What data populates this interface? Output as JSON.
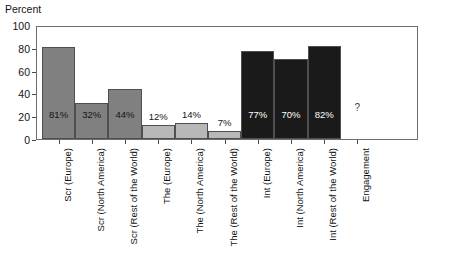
{
  "chart_data": {
    "type": "bar",
    "title": "",
    "ylabel": "Percent",
    "xlabel": "",
    "ylim": [
      0,
      100
    ],
    "yticks": [
      0,
      20,
      40,
      60,
      80,
      100
    ],
    "grid": false,
    "legend": "none",
    "categories": [
      "Scr (Europe)",
      "Scr (North America)",
      "Scr (Rest of the World)",
      "The (Europe)",
      "The (North America)",
      "The (Rest of the World)",
      "Int (Europe)",
      "Int (North America)",
      "Int (Rest of the World)",
      "Engagement"
    ],
    "values": [
      81,
      32,
      44,
      12,
      14,
      7,
      77,
      70,
      82,
      null
    ],
    "value_labels": [
      "81%",
      "32%",
      "44%",
      "12%",
      "14%",
      "7%",
      "77%",
      "70%",
      "82%",
      "?"
    ],
    "groups": [
      "Scr",
      "Scr",
      "Scr",
      "The",
      "The",
      "The",
      "Int",
      "Int",
      "Int",
      "Engagement"
    ],
    "group_colors": {
      "Scr": "#808080",
      "The": "#b8b8b8",
      "Int": "#1a1a1a",
      "Engagement": "#ffffff"
    },
    "label_colors": {
      "Scr": "#141414",
      "The": "#141414",
      "Int": "#ffffff",
      "Engagement": "#3c3c3c"
    },
    "label_placement": [
      "inside",
      "inside",
      "inside",
      "above",
      "above",
      "above",
      "inside",
      "inside",
      "inside",
      "none"
    ],
    "bar_edge_color": "#4f4f4f",
    "frame_color": "#6d6d6d"
  },
  "axis": {
    "y_title": "Percent",
    "y_tick_labels": [
      "100",
      "80",
      "60",
      "40",
      "20",
      "0"
    ]
  }
}
